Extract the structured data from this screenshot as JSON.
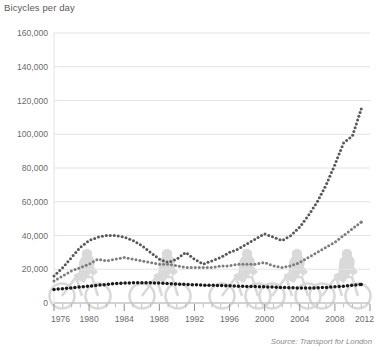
{
  "chart_data": {
    "type": "line",
    "title": "Bicycles per day",
    "subtitle": "",
    "xlabel": "",
    "ylabel": "Bicycles per day",
    "source": "Source: Transport for London",
    "grid": true,
    "legend_position": "none",
    "xlim": [
      1976,
      2012
    ],
    "ylim": [
      0,
      160000
    ],
    "ytick_values": [
      0,
      20000,
      40000,
      60000,
      80000,
      100000,
      120000,
      140000,
      160000
    ],
    "ytick_labels": [
      "0",
      "20,000",
      "40,000",
      "60,000",
      "80,000",
      "100,000",
      "120,000",
      "140,000",
      "160,000"
    ],
    "xtick_values": [
      1976,
      1980,
      1984,
      1988,
      1992,
      1996,
      2000,
      2004,
      2008,
      2012
    ],
    "xtick_labels": [
      "1976",
      "1980",
      "1984",
      "1988",
      "1992",
      "1996",
      "2000",
      "2004",
      "2008",
      "2012"
    ],
    "minor_xticks_every": 1,
    "x": [
      1976,
      1977,
      1978,
      1979,
      1980,
      1981,
      1982,
      1983,
      1984,
      1985,
      1986,
      1987,
      1988,
      1989,
      1990,
      1991,
      1992,
      1993,
      1994,
      1995,
      1996,
      1997,
      1998,
      1999,
      2000,
      2001,
      2002,
      2003,
      2004,
      2005,
      2006,
      2007,
      2008,
      2009,
      2010,
      2011
    ],
    "series": [
      {
        "name": "series-upper",
        "style": "dotted",
        "color": "#595959",
        "values": [
          16000,
          21000,
          27000,
          33000,
          37000,
          39000,
          40000,
          40000,
          39000,
          37000,
          34000,
          30000,
          26000,
          24000,
          26000,
          30000,
          26000,
          23000,
          25000,
          27000,
          30000,
          32000,
          35000,
          38000,
          41000,
          39000,
          37000,
          40000,
          45000,
          52000,
          60000,
          70000,
          82000,
          95000,
          99000,
          115000
        ]
      },
      {
        "name": "series-middle",
        "style": "dotted",
        "color": "#7d7d7d",
        "values": [
          13000,
          16000,
          19000,
          21000,
          23000,
          26000,
          25000,
          26000,
          27000,
          26000,
          25000,
          24000,
          23000,
          23000,
          22000,
          21000,
          21000,
          21000,
          21000,
          22000,
          22000,
          23000,
          23000,
          23000,
          24000,
          22000,
          21000,
          22000,
          24000,
          27000,
          30000,
          33000,
          36000,
          40000,
          44000,
          48000
        ]
      },
      {
        "name": "series-lower",
        "style": "dotted-bold",
        "color": "#1a1a1a",
        "values": [
          8000,
          8500,
          9000,
          9500,
          10000,
          10500,
          11000,
          11500,
          11800,
          12000,
          12000,
          12000,
          11800,
          11500,
          11200,
          11000,
          10800,
          10600,
          10500,
          10400,
          10200,
          10000,
          9800,
          9700,
          9600,
          9400,
          9200,
          9000,
          8900,
          8900,
          9000,
          9200,
          9600,
          10000,
          10500,
          11000
        ]
      }
    ],
    "peak_label": "143,000"
  },
  "chart_data_extra": {
    "upper_end_2011": 143000,
    "note": ""
  },
  "footer": {
    "source": "Source: Transport for London"
  },
  "header": {
    "title": "Bicycles per day"
  }
}
